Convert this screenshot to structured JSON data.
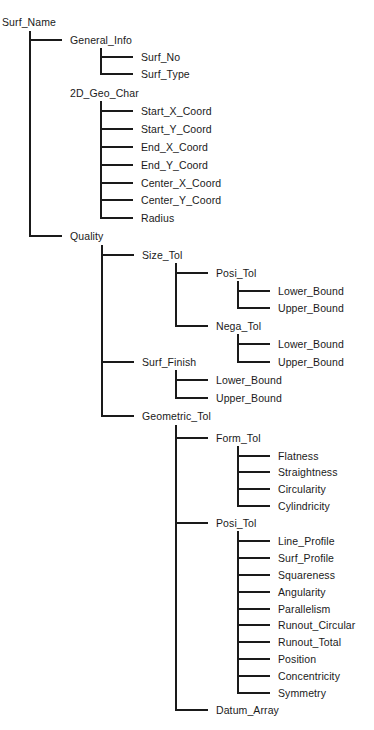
{
  "diagram": {
    "type": "tree",
    "root": "Surf_Name",
    "nodes": [
      {
        "id": "n0",
        "label": "Surf_Name",
        "level": 0,
        "y": 22,
        "connector": false
      },
      {
        "id": "n1",
        "label": "General_Info",
        "level": 1,
        "y": 40,
        "connector": true
      },
      {
        "id": "n2",
        "label": "Surf_No",
        "level": 2,
        "y": 57,
        "connector": true
      },
      {
        "id": "n3",
        "label": "Surf_Type",
        "level": 2,
        "y": 74,
        "connector": true
      },
      {
        "id": "n4",
        "label": "2D_Geo_Char",
        "level": 1,
        "y": 93,
        "connector": false
      },
      {
        "id": "n5",
        "label": "Start_X_Coord",
        "level": 2,
        "y": 111,
        "connector": true
      },
      {
        "id": "n6",
        "label": "Start_Y_Coord",
        "level": 2,
        "y": 129,
        "connector": true
      },
      {
        "id": "n7",
        "label": "End_X_Coord",
        "level": 2,
        "y": 147,
        "connector": true
      },
      {
        "id": "n8",
        "label": "End_Y_Coord",
        "level": 2,
        "y": 165,
        "connector": true
      },
      {
        "id": "n9",
        "label": "Center_X_Coord",
        "level": 2,
        "y": 183,
        "connector": true
      },
      {
        "id": "n10",
        "label": "Center_Y_Coord",
        "level": 2,
        "y": 200,
        "connector": true
      },
      {
        "id": "n11",
        "label": "Radius",
        "level": 2,
        "y": 218,
        "connector": true
      },
      {
        "id": "n12",
        "label": "Quality",
        "level": 1,
        "y": 236,
        "connector": true
      },
      {
        "id": "n13",
        "label": "Size_Tol",
        "level": 2,
        "y": 255,
        "connector": true
      },
      {
        "id": "n14",
        "label": "Posi_Tol",
        "level": 3,
        "y": 273,
        "connector": true
      },
      {
        "id": "n15",
        "label": "Lower_Bound",
        "level": 4,
        "y": 291,
        "connector": true
      },
      {
        "id": "n16",
        "label": "Upper_Bound",
        "level": 4,
        "y": 308,
        "connector": true
      },
      {
        "id": "n17",
        "label": "Nega_Tol",
        "level": 3,
        "y": 326,
        "connector": true
      },
      {
        "id": "n18",
        "label": "Lower_Bound",
        "level": 4,
        "y": 344,
        "connector": true
      },
      {
        "id": "n19",
        "label": "Upper_Bound",
        "level": 4,
        "y": 362,
        "connector": true
      },
      {
        "id": "n20",
        "label": "Surf_Finish",
        "level": 2,
        "y": 362,
        "connector": true
      },
      {
        "id": "n21",
        "label": "Lower_Bound",
        "level": 3,
        "y": 380,
        "connector": true
      },
      {
        "id": "n22",
        "label": "Upper_Bound",
        "level": 3,
        "y": 398,
        "connector": true
      },
      {
        "id": "n23",
        "label": "Geometric_Tol",
        "level": 2,
        "y": 416,
        "connector": true
      },
      {
        "id": "n24",
        "label": "Form_Tol",
        "level": 3,
        "y": 438,
        "connector": true
      },
      {
        "id": "n25",
        "label": "Flatness",
        "level": 4,
        "y": 456,
        "connector": true
      },
      {
        "id": "n26",
        "label": "Straightness",
        "level": 4,
        "y": 472,
        "connector": true
      },
      {
        "id": "n27",
        "label": "Circularity",
        "level": 4,
        "y": 489,
        "connector": true
      },
      {
        "id": "n28",
        "label": "Cylindricity",
        "level": 4,
        "y": 506,
        "connector": true
      },
      {
        "id": "n29",
        "label": "Posi_Tol",
        "level": 3,
        "y": 523,
        "connector": true
      },
      {
        "id": "n30",
        "label": "Line_Profile",
        "level": 4,
        "y": 541,
        "connector": true
      },
      {
        "id": "n31",
        "label": "Surf_Profile",
        "level": 4,
        "y": 558,
        "connector": true
      },
      {
        "id": "n32",
        "label": "Squareness",
        "level": 4,
        "y": 575,
        "connector": true
      },
      {
        "id": "n33",
        "label": "Angularity",
        "level": 4,
        "y": 592,
        "connector": true
      },
      {
        "id": "n34",
        "label": "Parallelism",
        "level": 4,
        "y": 609,
        "connector": true
      },
      {
        "id": "n35",
        "label": "Runout_Circular",
        "level": 4,
        "y": 625,
        "connector": true
      },
      {
        "id": "n36",
        "label": "Runout_Total",
        "level": 4,
        "y": 642,
        "connector": true
      },
      {
        "id": "n37",
        "label": "Position",
        "level": 4,
        "y": 659,
        "connector": true
      },
      {
        "id": "n38",
        "label": "Concentricity",
        "level": 4,
        "y": 676,
        "connector": true
      },
      {
        "id": "n39",
        "label": "Symmetry",
        "level": 4,
        "y": 693,
        "connector": true
      },
      {
        "id": "n40",
        "label": "Datum_Array",
        "level": 3,
        "y": 710,
        "connector": true
      }
    ]
  },
  "layout_hints": {
    "line_color": "#1a1a1a"
  }
}
